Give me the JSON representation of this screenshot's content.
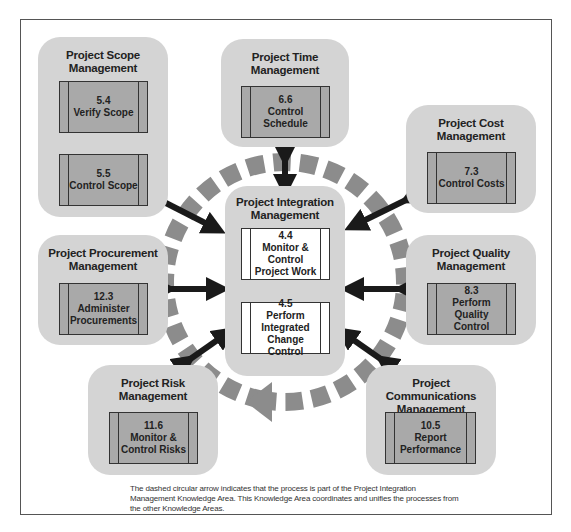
{
  "diagram": {
    "center": {
      "title": "Project Integration Management",
      "processes": [
        {
          "number": "4.4",
          "name": "Monitor & Control Project Work"
        },
        {
          "number": "4.5",
          "name": "Perform Integrated Change Control"
        }
      ]
    },
    "knowledge_areas": [
      {
        "id": "scope",
        "title": "Project Scope Management",
        "processes": [
          {
            "number": "5.4",
            "name": "Verify Scope"
          },
          {
            "number": "5.5",
            "name": "Control Scope"
          }
        ]
      },
      {
        "id": "time",
        "title": "Project Time Management",
        "processes": [
          {
            "number": "6.6",
            "name": "Control Schedule"
          }
        ]
      },
      {
        "id": "cost",
        "title": "Project Cost Management",
        "processes": [
          {
            "number": "7.3",
            "name": "Control Costs"
          }
        ]
      },
      {
        "id": "procurement",
        "title": "Project Procurement Management",
        "processes": [
          {
            "number": "12.3",
            "name": "Administer Procurements"
          }
        ]
      },
      {
        "id": "quality",
        "title": "Project Quality Management",
        "processes": [
          {
            "number": "8.3",
            "name": "Perform Quality Control"
          }
        ]
      },
      {
        "id": "risk",
        "title": "Project Risk Management",
        "processes": [
          {
            "number": "11.6",
            "name": "Monitor & Control Risks"
          }
        ]
      },
      {
        "id": "communications",
        "title": "Project Communications Management",
        "processes": [
          {
            "number": "10.5",
            "name": "Report Performance"
          }
        ]
      }
    ],
    "caption": "The dashed circular arrow indicates that the process is part of the Project Integration Management Knowledge Area. This Knowledge Area coordinates and unifies the processes from the other Knowledge Areas.",
    "colors": {
      "knowledge_area_bg": "#d4d4d4",
      "process_box": "#a9a9a9",
      "center_process_box": "#ffffff",
      "dashed_circle": "#8c8c8c",
      "arrows": "#1a1a1a"
    }
  }
}
